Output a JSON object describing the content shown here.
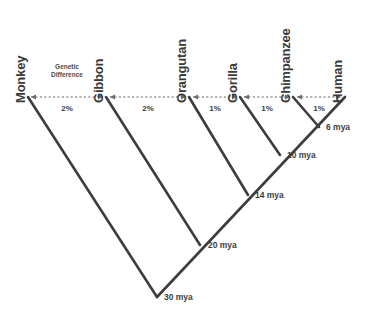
{
  "diagram": {
    "type": "phylogenetic-tree",
    "scale_label": {
      "line1": "Genetic",
      "line2": "Difference"
    },
    "colors": {
      "branch": "#3d3d3d",
      "axis": "#6b6b6b",
      "text": "#3a3a3a",
      "background": "#ffffff"
    },
    "taxa": [
      {
        "name": "Monkey",
        "x": 28,
        "label_y": 88
      },
      {
        "name": "Gibbon",
        "x": 106,
        "label_y": 88
      },
      {
        "name": "Orangutan",
        "x": 189,
        "label_y": 88
      },
      {
        "name": "Gorilla",
        "x": 240,
        "label_y": 88
      },
      {
        "name": "Chimpanzee",
        "x": 293,
        "label_y": 88
      },
      {
        "name": "Human",
        "x": 345,
        "label_y": 88
      }
    ],
    "genetic_differences": [
      {
        "from": "Monkey",
        "to": "Gibbon",
        "value": "2%",
        "x1": 31,
        "x2": 103,
        "label_x": 67,
        "label_y": 104
      },
      {
        "from": "Gibbon",
        "to": "Orangutan",
        "value": "2%",
        "x1": 110,
        "x2": 186,
        "label_x": 148,
        "label_y": 104
      },
      {
        "from": "Orangutan",
        "to": "Gorilla",
        "value": "1%",
        "x1": 193,
        "x2": 237,
        "label_x": 215,
        "label_y": 104
      },
      {
        "from": "Gorilla",
        "to": "Chimpanzee",
        "value": "1%",
        "x1": 244,
        "x2": 290,
        "label_x": 267,
        "label_y": 104
      },
      {
        "from": "Chimpanzee",
        "to": "Human",
        "value": "1%",
        "x1": 297,
        "x2": 341,
        "label_x": 319,
        "label_y": 104
      }
    ],
    "nodes": [
      {
        "id": "chimp-human",
        "label": "6 mya",
        "x": 319,
        "y": 127,
        "label_x": 326,
        "label_y": 122
      },
      {
        "id": "gorilla-clade",
        "label": "10 mya",
        "x": 280,
        "y": 155,
        "label_x": 287,
        "label_y": 150
      },
      {
        "id": "orang-clade",
        "label": "14 mya",
        "x": 248,
        "y": 195,
        "label_x": 255,
        "label_y": 190
      },
      {
        "id": "gibbon-clade",
        "label": "20 mya",
        "x": 200,
        "y": 245,
        "label_x": 208,
        "label_y": 240
      },
      {
        "id": "root",
        "label": "30 mya",
        "x": 157,
        "y": 297,
        "label_x": 164,
        "label_y": 292
      }
    ],
    "axis_y": 97
  }
}
